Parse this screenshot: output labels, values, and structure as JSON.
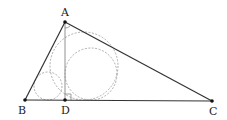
{
  "diagram": {
    "title": "",
    "points": {
      "A": {
        "label": "A",
        "x": 65,
        "y": 22
      },
      "B": {
        "label": "B",
        "x": 25,
        "y": 100
      },
      "C": {
        "label": "C",
        "x": 212,
        "y": 101
      },
      "D": {
        "label": "D",
        "x": 65,
        "y": 100
      }
    },
    "segments": [
      "AB",
      "BC",
      "CA",
      "AD"
    ],
    "right_angle_at": "D",
    "circles": [
      {
        "name": "incircle-ABC",
        "cx": 84,
        "cy": 66,
        "r": 34
      },
      {
        "name": "incircle-ACD",
        "cx": 91,
        "cy": 74,
        "r": 26
      },
      {
        "name": "incircle-ABD",
        "cx": 48,
        "cy": 86,
        "r": 14
      }
    ],
    "colors": {
      "edge": "#333333",
      "circle": "#999999",
      "altitude": "#777777"
    }
  }
}
